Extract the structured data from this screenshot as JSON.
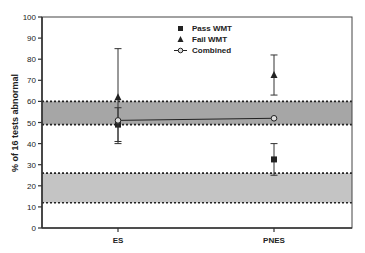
{
  "chart_data": {
    "type": "scatter",
    "title": "",
    "xlabel": "",
    "ylabel": "% of 16 tests abnormal",
    "ylim": [
      0,
      100
    ],
    "yticks": [
      0,
      10,
      20,
      30,
      40,
      50,
      60,
      70,
      80,
      90,
      100
    ],
    "categories": [
      "ES",
      "PNES"
    ],
    "grid": false,
    "legend_position": "top-center",
    "series": [
      {
        "name": "Pass WMT",
        "marker": "square",
        "values": [
          49,
          32.5
        ],
        "error_low": [
          41,
          25
        ],
        "error_high": [
          57,
          40
        ]
      },
      {
        "name": "Fail WMT",
        "marker": "triangle",
        "values": [
          62,
          72.5
        ],
        "error_low": [
          40,
          63
        ],
        "error_high": [
          85,
          82
        ]
      },
      {
        "name": "Combined",
        "marker": "open-circle",
        "line": true,
        "values": [
          51,
          52
        ]
      }
    ],
    "bands": [
      {
        "label": "upper reference band",
        "low": 49,
        "high": 60,
        "color": "#a6a6a6"
      },
      {
        "label": "lower reference band",
        "low": 12,
        "high": 26,
        "color": "#c4c4c4"
      }
    ]
  },
  "legend": {
    "items": [
      {
        "label": "Pass WMT",
        "symbol": "square"
      },
      {
        "label": "Fail WMT",
        "symbol": "triangle"
      },
      {
        "label": "Combined",
        "symbol": "line-circle"
      }
    ]
  },
  "colors": {
    "axis": "#333333",
    "marker": "#222222",
    "text": "#222222"
  }
}
